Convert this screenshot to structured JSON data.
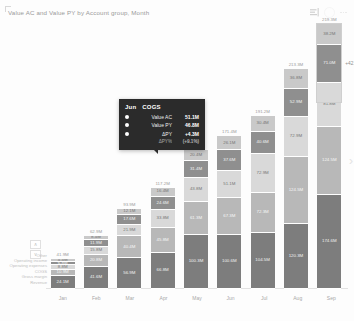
{
  "visual": {
    "title": "Value AC and Value PY by Account group, Month",
    "icons": {
      "filter": "filter-bars-icon",
      "focus": "focus-mode-icon"
    }
  },
  "legend": {
    "items": [
      {
        "label": "Other"
      },
      {
        "label": "Operating income"
      },
      {
        "label": "Operating expenses"
      },
      {
        "label": "COGS"
      },
      {
        "label": "Gross margin"
      },
      {
        "label": "Revenue"
      }
    ],
    "scroll_up": "∧",
    "scroll_down": "∨"
  },
  "annotation": {
    "delta_label": "+42.1M"
  },
  "tooltip": {
    "month": "Jun",
    "category": "COGS",
    "rows": [
      {
        "name": "Value AC",
        "value": "51.1M",
        "dot": true
      },
      {
        "name": "Value PY",
        "value": "46.8M",
        "dot": true
      },
      {
        "name": "ΔPY",
        "value": "+4.3M",
        "dot": true
      },
      {
        "name": "ΔPY%",
        "value": "(+9.1%)",
        "dot": false
      }
    ]
  },
  "chart_data": {
    "type": "bar",
    "subtype": "stacked-column",
    "title": "Value AC and Value PY by Account group, Month",
    "xlabel": "Month",
    "ylabel": "Value",
    "grid": false,
    "legend_position": "left",
    "categories": [
      "Jan",
      "Feb",
      "Mar",
      "Apr",
      "May",
      "Jun",
      "Jul",
      "Aug",
      "Sep"
    ],
    "series": [
      {
        "name": "Revenue",
        "color": "#7d7d7d",
        "values": [
          24.1,
          41.6,
          56.9,
          66.8,
          100.3,
          100.6,
          104.5,
          120.3,
          174.6
        ],
        "labels": [
          "24.1M",
          "41.6M",
          "56.9M",
          "66.8M",
          "100.3M",
          "100.6M",
          "104.5M",
          "120.3M",
          "174.6M"
        ]
      },
      {
        "name": "Gross margin",
        "color": "#b8b8b8",
        "values": [
          10.9,
          20.8,
          40.4,
          45.8,
          61.3,
          67.3,
          72.3,
          124.5,
          124.5
        ],
        "labels": [
          "10.9M",
          "20.8M",
          "40.4M",
          "45.8M",
          "61.3M",
          "67.3M",
          "72.3M",
          "124.5M",
          "124.5M"
        ]
      },
      {
        "name": "COGS",
        "color": "#d9d9d9",
        "values": [
          8.8,
          15.8,
          21.9,
          33.8,
          43.8,
          51.1,
          72.9,
          72.9,
          81.8
        ],
        "labels": [
          "8.8M",
          "15.8M",
          "21.9M",
          "33.8M",
          "43.8M",
          "51.1M",
          "72.9M",
          "72.9M",
          "81.8M"
        ]
      },
      {
        "name": "Operating expenses",
        "color": "#8f8f8f",
        "values": [
          6.8,
          11.9,
          17.6,
          24.6,
          31.4,
          37.6,
          40.6,
          52.9,
          71.0
        ],
        "labels": [
          "6.8M",
          "11.9M",
          "17.6M",
          "24.6M",
          "31.4M",
          "37.6M",
          "40.6M",
          "52.9M",
          "71.0M"
        ]
      },
      {
        "name": "Operating income",
        "color": "#c9c9c9",
        "values": [
          4.4,
          8.4,
          12.1,
          16.4,
          20.4,
          26.1,
          30.4,
          36.8,
          38.2
        ],
        "labels": [
          "4.4M",
          "8.4M",
          "12.1M",
          "16.4M",
          "20.4M",
          "26.1M",
          "30.4M",
          "36.8M",
          "38.2M"
        ]
      }
    ],
    "totals": [
      "41.9M",
      "62.9M",
      "93.9M",
      "117.2M",
      "141.5M",
      "171.4M",
      "191.2M",
      "213.3M",
      "219.3M"
    ],
    "annotations": [
      {
        "text": "+42.1M",
        "attached_to": "Sep"
      }
    ]
  }
}
